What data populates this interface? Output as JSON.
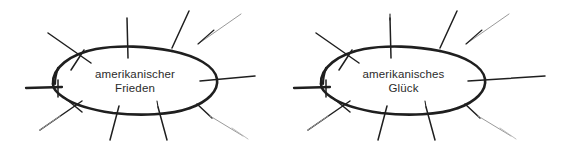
{
  "figure": {
    "type": "hand-drawn-diagram",
    "background_color": "#ffffff",
    "ink_color": "#1f1f1f",
    "faint_ink_color": "#8a8a8a"
  },
  "clusters": [
    {
      "id": "cluster-1",
      "label_line_1": "amerikanischer",
      "label_line_2": "Frieden",
      "ellipse": {
        "cx": 135,
        "cy": 81,
        "rx": 83,
        "ry": 33
      },
      "spoke_count": 11
    },
    {
      "id": "cluster-2",
      "label_line_1": "amerikanisches",
      "label_line_2": "Glück",
      "ellipse": {
        "cx": 403,
        "cy": 81,
        "rx": 83,
        "ry": 33
      },
      "spoke_count": 11
    }
  ]
}
